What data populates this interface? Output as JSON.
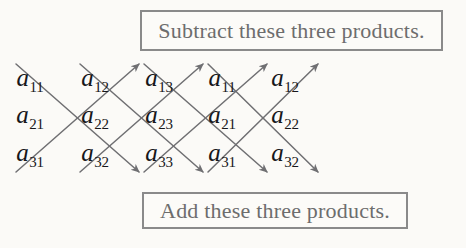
{
  "figure": {
    "background_color": "#fbfaf7",
    "entry_color": "#17171a",
    "arrow_color": "#6f6f72",
    "box_border_color": "#8a8a8a",
    "box_text_color": "#6d6d6d"
  },
  "callouts": {
    "subtract": {
      "label": "Subtract these three products.",
      "position": "top"
    },
    "add": {
      "label": "Add these three products.",
      "position": "bottom"
    }
  },
  "matrix": {
    "rows": 3,
    "columns": 5,
    "description": "3x3 matrix with first two columns repeated at the right",
    "entries": [
      [
        {
          "base": "a",
          "sub": "11"
        },
        {
          "base": "a",
          "sub": "12"
        },
        {
          "base": "a",
          "sub": "13"
        },
        {
          "base": "a",
          "sub": "11"
        },
        {
          "base": "a",
          "sub": "12"
        }
      ],
      [
        {
          "base": "a",
          "sub": "21"
        },
        {
          "base": "a",
          "sub": "22"
        },
        {
          "base": "a",
          "sub": "23"
        },
        {
          "base": "a",
          "sub": "21"
        },
        {
          "base": "a",
          "sub": "22"
        }
      ],
      [
        {
          "base": "a",
          "sub": "31"
        },
        {
          "base": "a",
          "sub": "32"
        },
        {
          "base": "a",
          "sub": "33"
        },
        {
          "base": "a",
          "sub": "31"
        },
        {
          "base": "a",
          "sub": "32"
        }
      ]
    ],
    "column_x": [
      30,
      95,
      159,
      222,
      285
    ],
    "row_y": [
      25,
      62,
      100
    ]
  },
  "arrows": {
    "descending": {
      "direction": "down-right",
      "meaning": "Add these three products.",
      "count": 3,
      "arrowhead": "at bottom end",
      "products": [
        "a11 a22 a33",
        "a12 a23 a31",
        "a13 a21 a32"
      ]
    },
    "ascending": {
      "direction": "up-right",
      "meaning": "Subtract these three products.",
      "count": 3,
      "arrowhead": "at top end",
      "products": [
        "a31 a22 a13",
        "a32 a23 a11",
        "a33 a21 a12"
      ]
    }
  }
}
